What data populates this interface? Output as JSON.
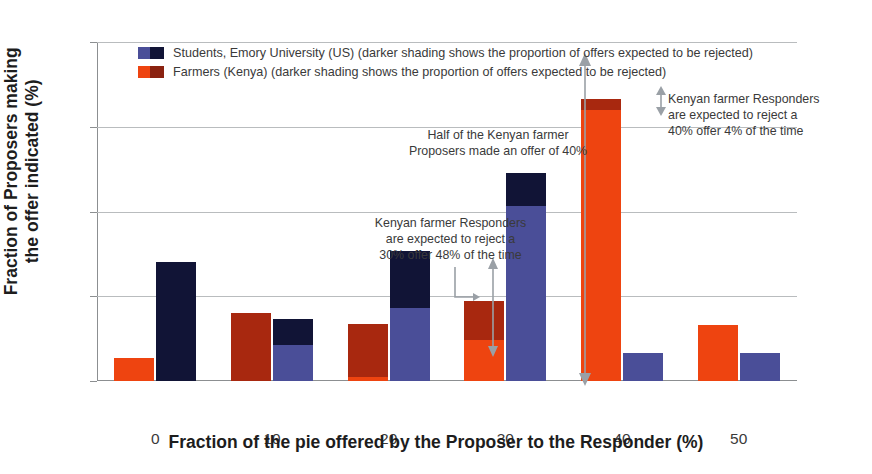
{
  "chart_data": {
    "type": "bar",
    "title": "",
    "xlabel": "Fraction of the pie offered by the Proposer to the Responder (%)",
    "ylabel": "Fraction of Proposers making\nthe offer indicated (%)",
    "categories": [
      "0",
      "10",
      "20",
      "30",
      "40",
      "50"
    ],
    "ylim": [
      0,
      60
    ],
    "yticks": [
      "0",
      "15",
      "30",
      "45",
      "60"
    ],
    "grid": true,
    "legend_position": "top-left",
    "series": [
      {
        "name": "Students, Emory University (US) (darker shading shows the proportion of offers expected to be rejected)",
        "key": "students",
        "color_accept": "#4a4e98",
        "color_reject": "#111436",
        "values": [
          21.0,
          11.0,
          23.0,
          36.8,
          5.0,
          5.0
        ],
        "rejected_portion": [
          21.0,
          4.6,
          10.0,
          5.8,
          0.0,
          0.0
        ]
      },
      {
        "name": "Farmers (Kenya) (darker shading shows the proportion of offers expected to be rejected)",
        "key": "farmers",
        "color_accept": "#ee4410",
        "color_reject": "#a8280f",
        "values": [
          4.1,
          12.0,
          10.1,
          14.1,
          50.0,
          10.0
        ],
        "rejected_portion": [
          0.0,
          12.0,
          9.4,
          6.8,
          2.0,
          0.0
        ]
      }
    ],
    "annotations": [
      {
        "key": "half_of_kenyan",
        "text": "Half of the Kenyan farmer Proposers made an offer of 40%"
      },
      {
        "key": "reject_30",
        "text": "Kenyan farmer Responders are expected to reject a 30% offer 48% of the time"
      },
      {
        "key": "reject_40",
        "text": "Kenyan farmer Responders are expected to reject a 40% offer 4% of the time"
      }
    ]
  },
  "axes": {
    "y_title_line1": "Fraction of Proposers making",
    "y_title_line2": "the offer indicated (%)",
    "x_title": "Fraction of the pie offered by the Proposer to the Responder (%)",
    "yticks": [
      "60",
      "45",
      "30",
      "15",
      "0"
    ],
    "xticks": [
      "0",
      "10",
      "20",
      "30",
      "40",
      "50"
    ]
  },
  "legend": {
    "items": [
      {
        "label": "Students, Emory University (US) (darker shading shows the proportion of offers expected to be rejected)",
        "swatch": "blue"
      },
      {
        "label": "Farmers (Kenya) (darker shading shows the proportion of offers expected to be rejected)",
        "swatch": "red"
      }
    ]
  },
  "annotations": {
    "half_line1": "Half of the Kenyan farmer",
    "half_line2": "Proposers made an offer of 40%",
    "r30_line1": "Kenyan farmer Responders",
    "r30_line2": "are expected to reject a",
    "r30_line3": "30% offer 48% of the time",
    "r40_line1": "Kenyan farmer Responders",
    "r40_line2": "are expected to reject a",
    "r40_line3": "40% offer 4% of the time"
  }
}
